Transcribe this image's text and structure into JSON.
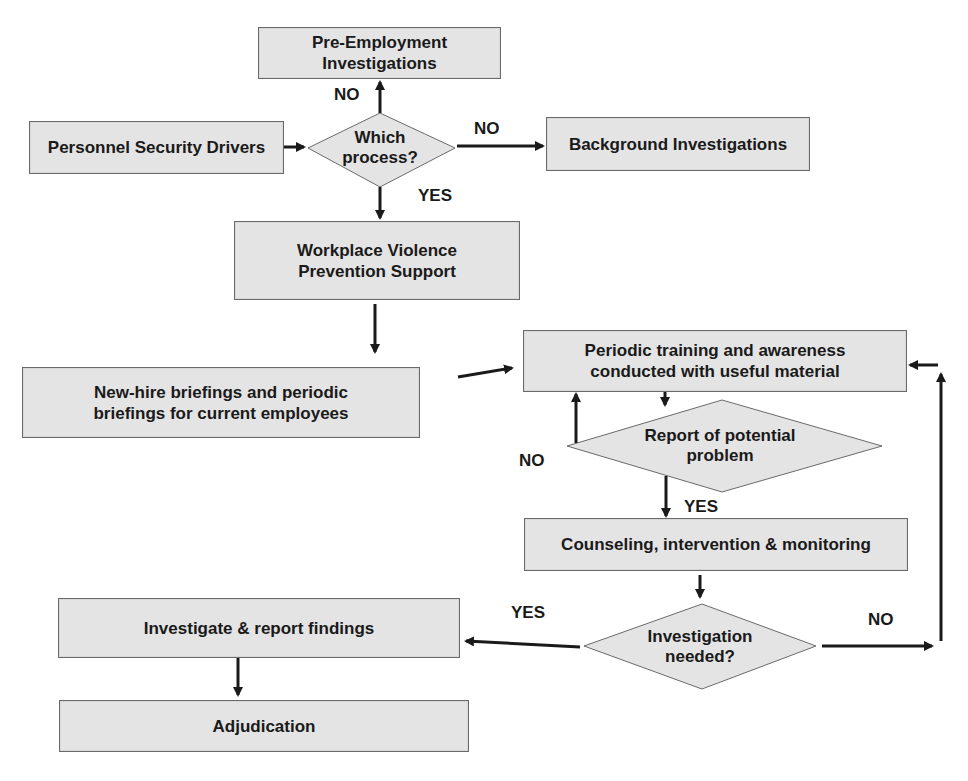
{
  "diagram": {
    "nodes": {
      "pre_employment": "Pre-Employment Investigations",
      "personnel_drivers": "Personnel Security Drivers",
      "which_process": "Which process?",
      "background": "Background Investigations",
      "workplace_violence": "Workplace Violence Prevention Support",
      "briefings": "New-hire briefings and periodic briefings for current employees",
      "periodic_training": "Periodic training and awareness conducted with useful material",
      "report_problem": "Report of potential problem",
      "counseling": "Counseling, intervention & monitoring",
      "investigation_needed": "Investigation needed?",
      "investigate_report": "Investigate & report findings",
      "adjudication": "Adjudication"
    },
    "edge_labels": {
      "which_to_pre": "NO",
      "which_to_background": "NO",
      "which_to_workplace": "YES",
      "report_to_training": "NO",
      "report_to_counseling": "YES",
      "investigation_to_investigate": "YES",
      "investigation_to_training": "NO"
    },
    "colors": {
      "box_fill": "#e4e4e4",
      "box_border": "#6a6a6a",
      "line": "#1a1a1a",
      "text": "#1a1a1a"
    }
  }
}
